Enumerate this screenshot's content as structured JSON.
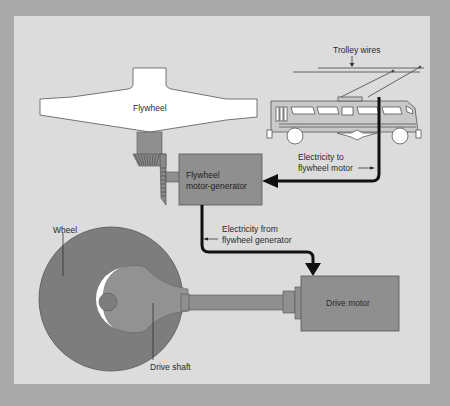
{
  "diagram": {
    "type": "mechanical-schematic",
    "colors": {
      "outer_background": "#a9a9a9",
      "panel_background": "#dcdcdc",
      "component_fill": "#8f8f8f",
      "flywheel_fill": "#ffffff",
      "wheel_fill": "#7d7d7d",
      "arrow_color": "#111111"
    },
    "labels": {
      "flywheel": "Flywheel",
      "trolley_wires": "Trolley wires",
      "motor_generator_line1": "Flywheel",
      "motor_generator_line2": "motor-generator",
      "electricity_to_line1": "Electricity to",
      "electricity_to_line2": "flywheel motor",
      "electricity_from_line1": "Electricity from",
      "electricity_from_line2": "flywheel generator",
      "wheel": "Wheel",
      "drive_shaft": "Drive shaft",
      "drive_motor": "Drive motor"
    },
    "nodes": [
      {
        "id": "trolley-wires",
        "label": "Trolley wires"
      },
      {
        "id": "trolley-bus",
        "label": ""
      },
      {
        "id": "flywheel",
        "label": "Flywheel"
      },
      {
        "id": "motor-generator",
        "label": "Flywheel motor-generator"
      },
      {
        "id": "drive-motor",
        "label": "Drive motor"
      },
      {
        "id": "drive-shaft",
        "label": "Drive shaft"
      },
      {
        "id": "wheel",
        "label": "Wheel"
      }
    ],
    "edges": [
      {
        "from": "trolley-bus",
        "to": "motor-generator",
        "label": "Electricity to flywheel motor"
      },
      {
        "from": "motor-generator",
        "to": "drive-motor",
        "label": "Electricity from flywheel generator"
      },
      {
        "from": "flywheel",
        "to": "motor-generator",
        "label": "bevel gear coupling"
      },
      {
        "from": "drive-motor",
        "to": "wheel",
        "label": "Drive shaft"
      }
    ]
  }
}
